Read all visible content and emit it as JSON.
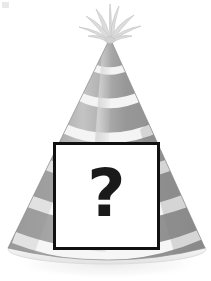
{
  "canvas": {
    "width": 211,
    "height": 281,
    "background_color": "#ffffff"
  },
  "illustration": {
    "subject": "party-hat",
    "title": "Gray striped party hat with question mark placeholder",
    "colors": {
      "hat_gray": "#9a9a9a",
      "hat_gray_dark": "#8a8a8a",
      "hat_gray_light": "#b9b9b9",
      "stripe_white": "#f2f2f2",
      "highlight": "#cfcfcf",
      "tassel": "#dcdcdc",
      "tassel_outline": "#c9c9c9",
      "brim": "#efefef",
      "brim_shadow": "#e6e6e6",
      "outline": "#8f8f8f",
      "shadow": "#ededed",
      "box_border": "#111111",
      "box_fill": "#ffffff",
      "question_color": "#1a1a1a"
    },
    "geometry": {
      "apex_x": 110,
      "apex_y": 38,
      "base_left_x": 8,
      "base_right_x": 205,
      "base_y": 250,
      "base_ellipse_ry": 14,
      "stripe_count": 6
    },
    "tassel": {
      "name": "tassel-pom-pom",
      "center_x": 110,
      "top_y": 2,
      "strand_count": 9
    }
  },
  "question_box": {
    "label": "?",
    "x": 53,
    "y": 142,
    "width": 107,
    "height": 108,
    "border_width": 3,
    "alt_text": "question mark placeholder box"
  },
  "artifacts": {
    "corner_speck_label": ""
  }
}
